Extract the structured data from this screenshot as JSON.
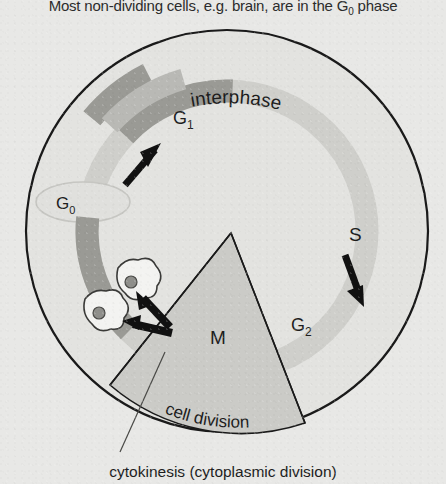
{
  "figure": {
    "type": "cell-cycle-diagram",
    "header_text": "Most non-dividing cells, e.g. brain, are in the G0 phase",
    "header_main": "Most non-dividing cells, e.g. brain, are in the G",
    "header_sub": "0",
    "header_tail": " phase",
    "caption_text": "cytokinesis (cytoplasmic division)"
  },
  "labels": {
    "interphase": "interphase",
    "cell_division": "cell division",
    "g1": "G",
    "g1_sub": "1",
    "g2": "G",
    "g2_sub": "2",
    "g0": "G",
    "g0_sub": "0",
    "s": "S",
    "m": "M"
  },
  "colors": {
    "background": "#e8e8e6",
    "outline": "#1a1a1a",
    "circle_fill": "#e2e2df",
    "interphase_ring": "#cfcfcc",
    "wedge_fill": "#cacac6",
    "mitosis_band": "#9a9a96",
    "cytokinesis_band": "#b5b5b1",
    "arrow": "#111111",
    "cell_fill": "#f2f2f0",
    "nucleus_fill": "#8f8f8b",
    "text": "#1d1d1d"
  },
  "geometry": {
    "circle_center_x": 227,
    "circle_center_y": 231,
    "circle_radius": 201,
    "ring_radius": 140,
    "ring_width": 23,
    "wedge_apex_x": 231,
    "wedge_apex_y": 233
  },
  "structure": {
    "phases": [
      "G1",
      "S",
      "G2",
      "M"
    ],
    "resting_phase": "G0",
    "daughter_cells": 2,
    "direction_arrows": [
      "g1-arrow",
      "s-arrow",
      "division-arrow-upper",
      "division-arrow-lower"
    ]
  }
}
